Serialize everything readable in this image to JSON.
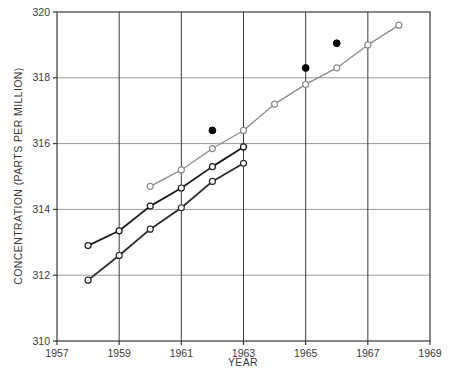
{
  "chart_data": {
    "type": "line",
    "title": "",
    "xlabel": "YEAR",
    "ylabel": "CONCENTRATION (PARTS PER MILLION)",
    "xlim": [
      1957,
      1969
    ],
    "ylim": [
      310,
      320
    ],
    "xticks": [
      1957,
      1959,
      1961,
      1963,
      1965,
      1967,
      1969
    ],
    "yticks": [
      310,
      312,
      314,
      316,
      318,
      320
    ],
    "xtick_labels": [
      "1957",
      "1959",
      "1961",
      "1963",
      "1965",
      "1967",
      "1969"
    ],
    "ytick_labels": [
      "310",
      "312",
      "314",
      "316",
      "318",
      "320"
    ],
    "grid": true,
    "legend": "none",
    "series": [
      {
        "name": "upper-gray-line",
        "style": "line-open-circle",
        "color": "#8c8c8c",
        "marker": "open-circle",
        "x": [
          1960,
          1961,
          1962,
          1963,
          1964,
          1965,
          1966,
          1967,
          1968
        ],
        "y": [
          314.7,
          315.2,
          315.85,
          316.4,
          317.2,
          317.8,
          318.3,
          319.0,
          319.6
        ]
      },
      {
        "name": "middle-black-line",
        "style": "line-open-circle",
        "color": "#1a1a1a",
        "marker": "open-circle",
        "x": [
          1958,
          1959,
          1960,
          1961,
          1962,
          1963
        ],
        "y": [
          312.9,
          313.35,
          314.1,
          314.65,
          315.3,
          315.9
        ]
      },
      {
        "name": "lower-black-line",
        "style": "line-open-circle",
        "color": "#2a2a2a",
        "marker": "open-circle",
        "x": [
          1958,
          1959,
          1960,
          1961,
          1962,
          1963
        ],
        "y": [
          311.85,
          312.6,
          313.4,
          314.05,
          314.85,
          315.4
        ]
      },
      {
        "name": "filled-points",
        "style": "scatter-filled",
        "color": "#000000",
        "marker": "filled-circle",
        "x": [
          1962,
          1965,
          1966
        ],
        "y": [
          316.4,
          318.3,
          319.05
        ]
      }
    ]
  },
  "axes": {
    "x_title": "YEAR",
    "y_title": "CONCENTRATION (PARTS PER MILLION)"
  }
}
